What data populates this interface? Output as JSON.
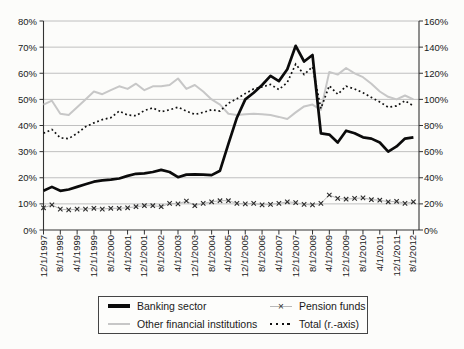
{
  "figure": {
    "width": 464,
    "height": 349,
    "background": "#fcfcfa"
  },
  "colors": {
    "banking": "#0b0b0b",
    "other_financial": "#c7c7c7",
    "total": "#111111",
    "pension_marker": "#2b2b2b",
    "pension_line": "#b8b8b8",
    "grid": "#b9b9b9",
    "axis": "#333333",
    "text": "#1a1a1a",
    "legend_border": "#444444"
  },
  "y_axis_left": {
    "min": 0,
    "max": 80,
    "tick_labels": [
      "0%",
      "10%",
      "20%",
      "30%",
      "40%",
      "50%",
      "60%",
      "70%",
      "80%"
    ]
  },
  "y_axis_right": {
    "min": 0,
    "max": 160,
    "tick_labels": [
      "0%",
      "20%",
      "40%",
      "60%",
      "80%",
      "100%",
      "120%",
      "140%",
      "160%"
    ]
  },
  "x_axis": {
    "tick_labels": [
      "12/1/1997",
      "8/1/1998",
      "4/1/1999",
      "12/1/1999",
      "8/1/2000",
      "4/1/2001",
      "12/1/2001",
      "8/1/2002",
      "4/1/2003",
      "12/1/2003",
      "8/1/2004",
      "4/1/2005",
      "12/1/2005",
      "8/1/2006",
      "4/1/2007",
      "12/1/2007",
      "8/1/2008",
      "4/1/2009",
      "12/1/2009",
      "8/1/2010",
      "4/1/2011",
      "12/1/2011",
      "8/1/2012"
    ]
  },
  "legend": {
    "items": [
      {
        "label": "Banking sector",
        "style": "thick-black"
      },
      {
        "label": "Pension funds",
        "style": "x-marker"
      },
      {
        "label": "Other financial institutions",
        "style": "light-gray"
      },
      {
        "label": "Total (r.-axis)",
        "style": "dotted"
      }
    ]
  },
  "chart_data": {
    "type": "line",
    "grid": "horizontal",
    "legend_position": "bottom",
    "ylim_left": [
      0,
      80
    ],
    "ylim_right": [
      0,
      160
    ],
    "x": [
      "12/1/1997",
      "4/1/1998",
      "8/1/1998",
      "12/1/1998",
      "4/1/1999",
      "8/1/1999",
      "12/1/1999",
      "4/1/2000",
      "8/1/2000",
      "12/1/2000",
      "4/1/2001",
      "8/1/2001",
      "12/1/2001",
      "4/1/2002",
      "8/1/2002",
      "12/1/2002",
      "4/1/2003",
      "8/1/2003",
      "12/1/2003",
      "4/1/2004",
      "8/1/2004",
      "12/1/2004",
      "4/1/2005",
      "8/1/2005",
      "12/1/2005",
      "4/1/2006",
      "8/1/2006",
      "12/1/2006",
      "4/1/2007",
      "8/1/2007",
      "12/1/2007",
      "4/1/2008",
      "8/1/2008",
      "12/1/2008",
      "4/1/2009",
      "8/1/2009",
      "12/1/2009",
      "4/1/2010",
      "8/1/2010",
      "12/1/2010",
      "4/1/2011",
      "8/1/2011",
      "12/1/2011",
      "4/1/2012",
      "8/1/2012"
    ],
    "series": [
      {
        "name": "Banking sector",
        "axis": "left",
        "style": "thick-black",
        "unit": "%",
        "values": [
          15,
          16.5,
          15,
          15.5,
          16.5,
          17.5,
          18.5,
          19,
          19.3,
          19.7,
          20.7,
          21.5,
          21.7,
          22.2,
          23,
          22.2,
          20.2,
          21.2,
          21.3,
          21.2,
          21,
          22.7,
          33,
          43,
          50,
          52.5,
          55.5,
          59,
          57,
          61.5,
          70.5,
          64.5,
          67,
          37,
          36.5,
          33.5,
          38,
          37,
          35.5,
          35,
          33.5,
          30,
          32,
          35,
          35.5
        ]
      },
      {
        "name": "Pension funds",
        "axis": "left",
        "style": "x-marker",
        "unit": "%",
        "values": [
          8.5,
          9.6,
          8,
          7.7,
          8,
          8,
          8.3,
          8,
          8.3,
          8.3,
          8.5,
          8.9,
          9.3,
          9.3,
          8.9,
          10.2,
          10,
          11.1,
          9.3,
          10.2,
          10.8,
          11.2,
          11.2,
          10.2,
          10,
          10.2,
          9.6,
          9.8,
          10.2,
          10.8,
          10.5,
          9.8,
          9.6,
          10.2,
          13.4,
          12.1,
          11.8,
          12.1,
          12.3,
          11.6,
          11.4,
          10.8,
          11,
          10.2,
          10.8
        ]
      },
      {
        "name": "Other financial institutions",
        "axis": "left",
        "style": "light-gray",
        "unit": "%",
        "values": [
          48,
          49.5,
          44.5,
          44,
          47,
          50,
          53,
          52,
          53.5,
          55,
          54,
          56,
          53.5,
          55,
          55,
          55.5,
          58,
          54,
          55.5,
          53,
          50,
          48,
          44.5,
          44,
          44.3,
          44.5,
          44.3,
          44,
          43.3,
          42.5,
          45,
          47.3,
          48,
          46,
          60.5,
          59.5,
          62,
          60,
          58.5,
          56,
          53,
          51,
          50,
          51.5,
          50
        ]
      },
      {
        "name": "Total (r.-axis)",
        "axis": "right",
        "style": "dotted",
        "unit": "%",
        "values": [
          74,
          77,
          70.5,
          70,
          74,
          79,
          82,
          84.5,
          86,
          91,
          88,
          87.5,
          91.5,
          93.5,
          90.5,
          92,
          94,
          91,
          88.5,
          90,
          92,
          91,
          97,
          100.5,
          104.5,
          108,
          109.5,
          111.5,
          107.5,
          113,
          127,
          119,
          125,
          93,
          110.5,
          104,
          110,
          108,
          105,
          101.5,
          98,
          94,
          95,
          99,
          95
        ]
      }
    ]
  }
}
